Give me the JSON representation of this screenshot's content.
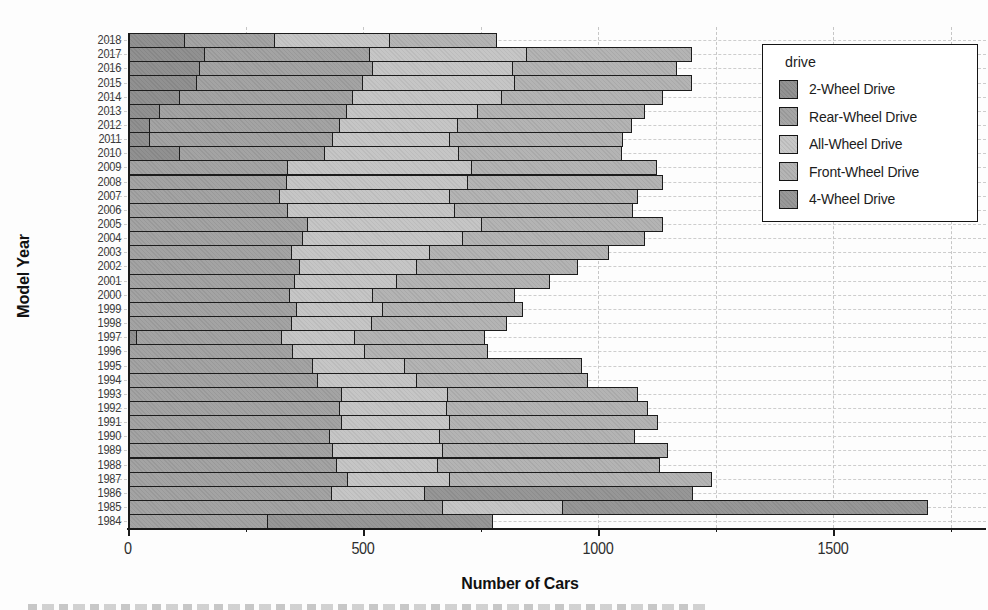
{
  "chart_data": {
    "type": "bar",
    "orientation": "horizontal",
    "stacked": true,
    "title": "",
    "xlabel": "Number of Cars",
    "ylabel": "Model Year",
    "x_ticks": [
      0,
      500,
      1000,
      1500
    ],
    "x_minor_tick_interval": 250,
    "xlim": [
      0,
      1825
    ],
    "grid": "dashed-light",
    "legend": {
      "title": "drive",
      "position": "upper-right"
    },
    "categories": [
      "2018",
      "2017",
      "2016",
      "2015",
      "2014",
      "2013",
      "2012",
      "2011",
      "2010",
      "2009",
      "2008",
      "2007",
      "2006",
      "2005",
      "2004",
      "2003",
      "2002",
      "2001",
      "2000",
      "1999",
      "1998",
      "1997",
      "1996",
      "1995",
      "1994",
      "1993",
      "1992",
      "1991",
      "1990",
      "1989",
      "1988",
      "1987",
      "1986",
      "1985",
      "1984"
    ],
    "series": [
      {
        "name": "2-Wheel Drive",
        "color": "#8d8d8d",
        "values": [
          121,
          164,
          153,
          147,
          111,
          68,
          47,
          47,
          110,
          0,
          0,
          0,
          0,
          0,
          0,
          0,
          0,
          0,
          0,
          0,
          0,
          19,
          0,
          0,
          0,
          0,
          0,
          0,
          0,
          0,
          0,
          0,
          0,
          0,
          0
        ]
      },
      {
        "name": "Rear-Wheel Drive",
        "color": "#a0a0a0",
        "values": [
          191,
          351,
          368,
          353,
          368,
          398,
          404,
          389,
          310,
          340,
          338,
          323,
          340,
          383,
          372,
          349,
          366,
          355,
          345,
          360,
          349,
          309,
          351,
          394,
          404,
          455,
          451,
          455,
          430,
          436,
          445,
          468,
          434,
          670,
          298
        ]
      },
      {
        "name": "All-Wheel Drive",
        "color": "#c4c4c4",
        "values": [
          245,
          334,
          298,
          323,
          317,
          279,
          251,
          249,
          285,
          391,
          385,
          362,
          355,
          370,
          340,
          294,
          249,
          217,
          177,
          183,
          170,
          155,
          153,
          196,
          211,
          226,
          228,
          230,
          234,
          234,
          215,
          217,
          198,
          255,
          0
        ]
      },
      {
        "name": "Front-Wheel Drive",
        "color": "#b1b1b1",
        "values": [
          228,
          351,
          349,
          377,
          343,
          355,
          370,
          368,
          346,
          394,
          415,
          400,
          379,
          385,
          389,
          381,
          343,
          326,
          302,
          298,
          287,
          277,
          262,
          377,
          364,
          404,
          428,
          443,
          415,
          479,
          472,
          557,
          0,
          0,
          0
        ]
      },
      {
        "name": "4-Wheel Drive",
        "color": "#939393",
        "values": [
          0,
          0,
          0,
          0,
          0,
          0,
          0,
          0,
          0,
          0,
          0,
          0,
          0,
          0,
          0,
          0,
          0,
          0,
          0,
          0,
          0,
          0,
          0,
          0,
          0,
          0,
          0,
          0,
          0,
          0,
          0,
          0,
          570,
          777,
          479
        ]
      }
    ],
    "totals": [
      785,
      1200,
      1168,
      1200,
      1139,
      1100,
      1072,
      1053,
      1051,
      1125,
      1138,
      1085,
      1074,
      1138,
      1101,
      1024,
      958,
      898,
      824,
      841,
      806,
      760,
      766,
      967,
      979,
      1085,
      1107,
      1128,
      1079,
      1149,
      1132,
      1242,
      1202,
      1702,
      777
    ]
  },
  "style": {
    "bar_edge_color": "#1c1c1c",
    "grid_color": "#c9c9c9",
    "background": "#fdfdfd"
  }
}
